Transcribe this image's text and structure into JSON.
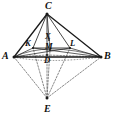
{
  "figure": {
    "type": "geometry-diagram",
    "canvas": {
      "width": 117,
      "height": 120,
      "background": "#ffffff"
    },
    "stroke_color": "#1a1a1a",
    "dashed_color": "#4a4a4a",
    "points": [
      {
        "id": "C",
        "label": "C",
        "x": 47,
        "y": 14,
        "label_x": 45,
        "label_y": 1,
        "size": "main"
      },
      {
        "id": "A",
        "label": "A",
        "x": 14,
        "y": 57,
        "label_x": 2,
        "label_y": 51,
        "size": "main"
      },
      {
        "id": "B",
        "label": "B",
        "x": 101,
        "y": 57,
        "label_x": 104,
        "label_y": 51,
        "size": "main"
      },
      {
        "id": "E",
        "label": "E",
        "x": 47,
        "y": 98,
        "label_x": 44,
        "label_y": 104,
        "size": "main"
      },
      {
        "id": "D",
        "label": "D",
        "x": 47,
        "y": 55,
        "label_x": 44,
        "label_y": 56,
        "size": "inner"
      },
      {
        "id": "K",
        "label": "K",
        "x": 33,
        "y": 48,
        "label_x": 25,
        "label_y": 39,
        "size": "inner"
      },
      {
        "id": "L",
        "label": "L",
        "x": 70,
        "y": 48,
        "label_x": 70,
        "label_y": 39,
        "size": "inner"
      },
      {
        "id": "M",
        "label": "M",
        "x": 50,
        "y": 50,
        "label_x": 45,
        "label_y": 42,
        "size": "inner"
      },
      {
        "id": "X",
        "label": "X",
        "x": 49,
        "y": 40,
        "label_x": 45,
        "label_y": 32,
        "size": "inner"
      }
    ],
    "solid_edges": [
      {
        "from": "C",
        "to": "A",
        "width": 1.3
      },
      {
        "from": "C",
        "to": "B",
        "width": 1.3
      },
      {
        "from": "C",
        "to": "K",
        "width": 0.8
      },
      {
        "from": "C",
        "to": "L",
        "width": 0.8
      },
      {
        "from": "C",
        "to": "D",
        "width": 0.8
      },
      {
        "from": "C",
        "to": "M",
        "width": 0.7
      },
      {
        "from": "A",
        "to": "B",
        "width": 1.3
      },
      {
        "from": "A",
        "to": "L",
        "width": 0.7
      },
      {
        "from": "B",
        "to": "K",
        "width": 0.7
      },
      {
        "from": "K",
        "to": "L",
        "width": 0.8
      },
      {
        "from": "K",
        "to": "A",
        "width": 0.7
      },
      {
        "from": "L",
        "to": "B",
        "width": 0.7
      }
    ],
    "dashed_edges": [
      {
        "from": "E",
        "to": "A"
      },
      {
        "from": "E",
        "to": "K"
      },
      {
        "from": "E",
        "to": "D"
      },
      {
        "from": "E",
        "to": "M"
      },
      {
        "from": "E",
        "to": "L"
      },
      {
        "from": "E",
        "to": "B"
      },
      {
        "from": "D",
        "to": "A"
      },
      {
        "from": "D",
        "to": "B"
      }
    ],
    "arcs": [
      {
        "id": "base-arc-upper",
        "d": "M 14 57 Q 47 41 101 57",
        "dashed": false,
        "width": 0.6
      },
      {
        "id": "base-arc-lower",
        "d": "M 14 57 Q 47 64 101 57",
        "dashed": true,
        "width": 0.6
      }
    ]
  }
}
